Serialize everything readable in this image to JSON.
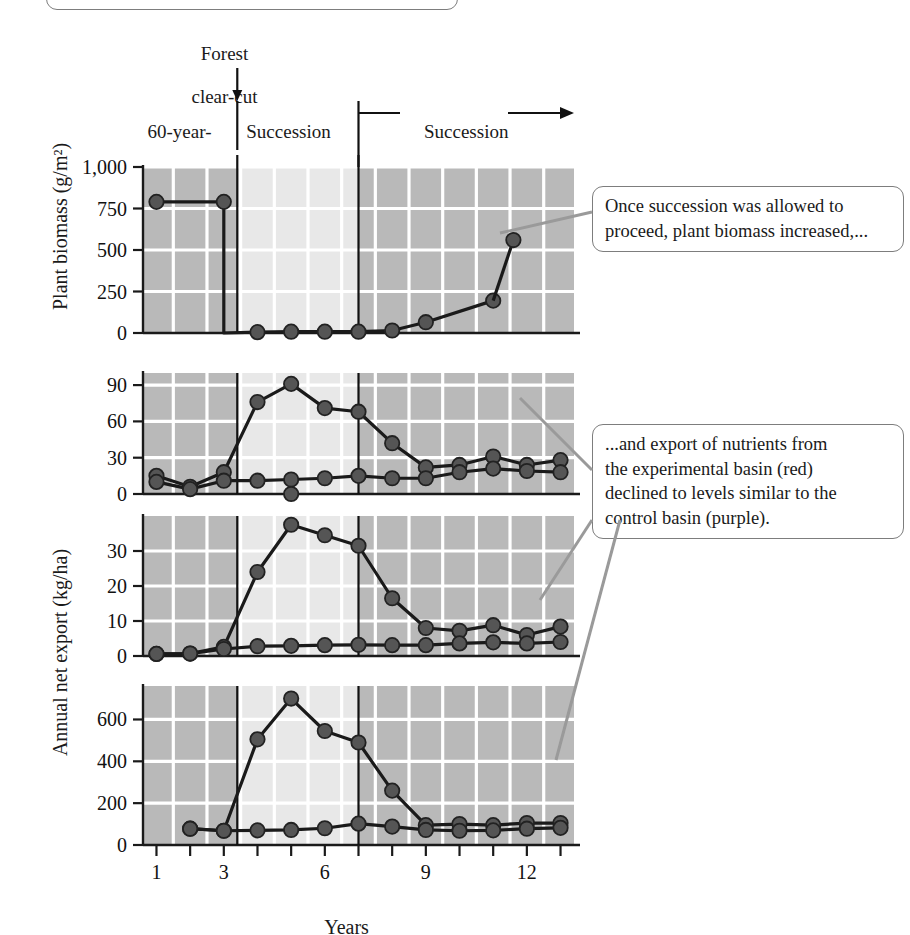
{
  "header": {
    "clear_cut_label_line1": "Forest",
    "clear_cut_label_line2": "clear-cut",
    "zone1_line1": "60-year-",
    "zone1_line2": "old forest",
    "zone2_line1": "Succession",
    "zone2_line2": "suppressed",
    "zone3_label": "Succession"
  },
  "axes": {
    "x_title": "Years",
    "x_ticklabels": [
      "1",
      "3",
      "6",
      "9",
      "12"
    ],
    "x_tickvalues": [
      1,
      3,
      6,
      9,
      12
    ],
    "y_title_top": "Plant biomass (g/m²)",
    "y_title_lower": "Annual net export (kg/ha)"
  },
  "callouts": [
    {
      "id": "biomass-callout",
      "lines": [
        "Once succession was allowed to",
        "proceed, plant biomass increased,..."
      ]
    },
    {
      "id": "nutrient-callout",
      "lines": [
        "...and export of nutrients from",
        "the experimental basin (red)",
        "declined to levels similar to the",
        "control basin (purple)."
      ]
    }
  ],
  "colors": {
    "band_dark": "#b9b9b9",
    "band_light": "#e8e8e8",
    "gridline": "#ffffff",
    "series_marker": "#555555",
    "series_line": "#1a1a1a",
    "callout_border": "#7d7d7d",
    "leader_line": "#9a9a9a",
    "axis": "#1a1a1a"
  },
  "chart_data": [
    {
      "type": "line",
      "title": "Plant biomass",
      "xlabel": "Years",
      "ylabel": "Plant biomass (g/m²)",
      "xlim": [
        0.6,
        13.4
      ],
      "ylim": [
        0,
        1000
      ],
      "yticks": [
        0,
        250,
        500,
        750,
        1000
      ],
      "yticklabels": [
        "0",
        "250",
        "500",
        "750",
        "1,000"
      ],
      "grid": true,
      "series": [
        {
          "name": "experimental basin",
          "x": [
            1,
            3,
            3,
            4,
            5,
            6,
            7,
            8,
            9,
            11
          ],
          "values": [
            790,
            790,
            0,
            5,
            8,
            8,
            8,
            15,
            65,
            195
          ],
          "marker_x": [
            1,
            3,
            4,
            5,
            6,
            7,
            8,
            9,
            11
          ],
          "marker_values": [
            790,
            790,
            5,
            8,
            8,
            8,
            15,
            65,
            195
          ]
        }
      ],
      "extra_point": {
        "x": 11.6,
        "value": 560
      }
    },
    {
      "type": "line",
      "title": "Calcium",
      "xlabel": "Years",
      "ylabel": "Annual net export (kg/ha)",
      "xlim": [
        0.6,
        13.4
      ],
      "ylim": [
        0,
        100
      ],
      "yticks": [
        0,
        30,
        60,
        90
      ],
      "yticklabels": [
        "0",
        "30",
        "60",
        "90"
      ],
      "grid": true,
      "series": [
        {
          "name": "experimental basin (red)",
          "x": [
            1,
            2,
            3,
            4,
            5,
            6,
            7,
            8,
            9,
            10,
            11,
            12,
            13
          ],
          "values": [
            15,
            6,
            18,
            76,
            91,
            71,
            68,
            42,
            22,
            24,
            31,
            24,
            28
          ]
        },
        {
          "name": "control basin (purple)",
          "x": [
            1,
            2,
            3,
            4,
            5,
            6,
            7,
            8,
            9,
            10,
            11,
            12,
            13
          ],
          "values": [
            10,
            4,
            11,
            11,
            12,
            13,
            15,
            13,
            13,
            18,
            21,
            19,
            18
          ]
        }
      ],
      "extra_point": {
        "x": 5,
        "value": 0
      }
    },
    {
      "type": "line",
      "title": "Potassium",
      "xlabel": "Years",
      "ylabel": "Annual net export (kg/ha)",
      "xlim": [
        0.6,
        13.4
      ],
      "ylim": [
        0,
        40
      ],
      "yticks": [
        0,
        10,
        20,
        30
      ],
      "yticklabels": [
        "0",
        "10",
        "20",
        "30"
      ],
      "grid": true,
      "series": [
        {
          "name": "experimental basin (red)",
          "x": [
            1,
            2,
            3,
            4,
            5,
            6,
            7,
            8,
            9,
            10,
            11,
            12,
            13
          ],
          "values": [
            0.6,
            0.7,
            2.6,
            24,
            37.5,
            34.5,
            31.5,
            16.5,
            8,
            7.2,
            8.8,
            6,
            8.4
          ]
        },
        {
          "name": "control basin (purple)",
          "x": [
            1,
            2,
            3,
            4,
            5,
            6,
            7,
            8,
            9,
            10,
            11,
            12,
            13
          ],
          "values": [
            0.6,
            0.7,
            2.0,
            2.8,
            2.9,
            3.1,
            3.2,
            3.1,
            3.1,
            3.6,
            3.9,
            3.6,
            4.0
          ]
        }
      ]
    },
    {
      "type": "line",
      "title": "Nitrate",
      "xlabel": "Years",
      "ylabel": "Annual net export (kg/ha)",
      "xlim": [
        0.6,
        13.4
      ],
      "ylim": [
        0,
        760
      ],
      "yticks": [
        0,
        200,
        400,
        600
      ],
      "yticklabels": [
        "0",
        "200",
        "400",
        "600"
      ],
      "grid": true,
      "series": [
        {
          "name": "experimental basin (red)",
          "x": [
            2,
            3,
            4,
            5,
            6,
            7,
            8,
            9,
            10,
            11,
            12,
            13
          ],
          "values": [
            78,
            68,
            505,
            700,
            545,
            490,
            260,
            95,
            100,
            95,
            105,
            105
          ]
        },
        {
          "name": "control basin (purple)",
          "x": [
            2,
            3,
            4,
            5,
            6,
            7,
            8,
            9,
            10,
            11,
            12,
            13
          ],
          "values": [
            78,
            68,
            70,
            72,
            80,
            102,
            88,
            72,
            68,
            70,
            78,
            82
          ]
        }
      ]
    }
  ],
  "zones": {
    "zone1_range": [
      0.6,
      3.4
    ],
    "zone2_range": [
      3.4,
      7.0
    ],
    "zone3_range": [
      7.0,
      13.4
    ]
  }
}
